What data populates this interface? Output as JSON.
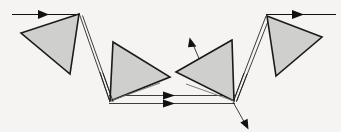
{
  "figure": {
    "background_color": "#f5f4f2",
    "prism_fill_color": "#cfcfcd",
    "prism_stroke_color": "#1a1a1a",
    "ray_color": "#111111",
    "canvas": {
      "width": 341,
      "height": 132
    }
  },
  "chart_data": {
    "type": "diagram",
    "xlabel": "",
    "ylabel": "",
    "grid": false,
    "legend": "none",
    "xlim": [
      0,
      341
    ],
    "ylim": [
      0,
      132
    ],
    "prisms": [
      {
        "name": "prism-1",
        "label": "1",
        "points": "79,14 21,33 70,74",
        "internal_edge": "",
        "orientation": "apex-top-right"
      },
      {
        "name": "prism-2",
        "label": "2",
        "points": "113,42 170,77 110,101",
        "internal_edge": "110,101 160,83",
        "orientation": "apex-right"
      },
      {
        "name": "prism-3",
        "label": "3",
        "points": "232,40 176,72 234,101",
        "internal_edge": "234,101 186,84",
        "orientation": "apex-left"
      },
      {
        "name": "prism-4",
        "label": "4",
        "points": "267,16 322,37 276,76",
        "internal_edge": "",
        "orientation": "apex-top-left"
      }
    ],
    "rays": [
      {
        "name": "incoming-ray",
        "path": "12,14 79,14",
        "arrow_at": [
          47,
          14
        ],
        "arrow_angle_deg": 0,
        "style": "solid"
      },
      {
        "name": "ray-prism1-to-prism2-upper",
        "path": "79,14 110,100",
        "arrow_at": null,
        "style": "solid"
      },
      {
        "name": "ray-prism1-to-prism2-lower",
        "path": "82,15 113,101",
        "arrow_at": null,
        "style": "solid"
      },
      {
        "name": "ray-prism2-to-prism3-upper",
        "path": "110,96 234,96",
        "arrow_at": [
          172,
          96
        ],
        "arrow_angle_deg": 0,
        "style": "solid"
      },
      {
        "name": "ray-prism2-to-prism3-lower",
        "path": "110,103 234,103",
        "arrow_at": [
          172,
          103
        ],
        "arrow_angle_deg": 0,
        "style": "solid"
      },
      {
        "name": "ray-prism3-to-prism4-upper",
        "path": "234,101 266,16",
        "arrow_at": null,
        "style": "solid"
      },
      {
        "name": "ray-prism3-to-prism4-lower",
        "path": "237,101 269,17",
        "arrow_at": null,
        "style": "solid"
      },
      {
        "name": "outgoing-ray",
        "path": "267,14 336,14",
        "arrow_at": [
          303,
          14
        ],
        "arrow_angle_deg": 0,
        "style": "solid"
      },
      {
        "name": "reflected-ray-up-left",
        "path": "207,77 190,39",
        "arrow_at": [
          190,
          39
        ],
        "arrow_angle_deg": 246,
        "style": "solid"
      },
      {
        "name": "reflected-ray-down-right",
        "path": "233,102 248,129",
        "arrow_at": [
          248,
          129
        ],
        "arrow_angle_deg": 61,
        "style": "solid"
      }
    ]
  }
}
